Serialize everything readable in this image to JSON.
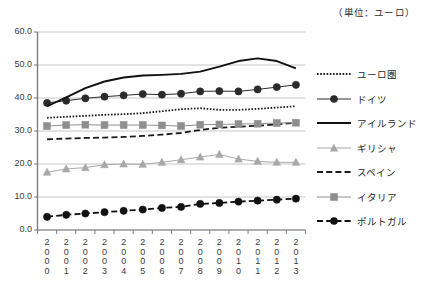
{
  "unit_caption": "（単位：ユーロ）",
  "legend": {
    "position": "right",
    "items": [
      {
        "label": "ユーロ圏",
        "key": "dotted-line-key",
        "color": "#1a1a1a",
        "style": "dotted",
        "marker": "none"
      },
      {
        "label": "ドイツ",
        "key": "line-circle-key",
        "color": "#2b2b2b",
        "style": "solid-thin",
        "marker": "circle"
      },
      {
        "label": "アイルランド",
        "key": "thick-solid-line-key",
        "color": "#111111",
        "style": "solid-thick",
        "marker": "none"
      },
      {
        "label": "ギリシャ",
        "key": "gray-line-triangle-key",
        "color": "#a8a8a8",
        "style": "solid-thin",
        "marker": "triangle"
      },
      {
        "label": "スペイン",
        "key": "dashed-line-key",
        "color": "#1a1a1a",
        "style": "dashed",
        "marker": "none"
      },
      {
        "label": "イタリア",
        "key": "gray-line-square-key",
        "color": "#8f8f8f",
        "style": "solid-thin",
        "marker": "square"
      },
      {
        "label": "ポルトガル",
        "key": "dashed-line-circle-key",
        "color": "#111111",
        "style": "dashed",
        "marker": "circle"
      }
    ]
  },
  "axes": {
    "y_ticks": [
      "0.0",
      "10.0",
      "20.0",
      "30.0",
      "40.0",
      "50.0",
      "60.0"
    ],
    "x_ticks": [
      "2\n0\n0\n0",
      "2\n0\n0\n1",
      "2\n0\n0\n2",
      "2\n0\n0\n3",
      "2\n0\n0\n4",
      "2\n0\n0\n5",
      "2\n0\n0\n6",
      "2\n0\n0\n7",
      "2\n0\n0\n8",
      "2\n0\n0\n9",
      "2\n0\n1\n0",
      "2\n0\n1\n1",
      "2\n0\n1\n2",
      "2\n0\n1\n3"
    ]
  },
  "chart_data": {
    "type": "line",
    "title": "",
    "subtitle": "",
    "xlabel": "",
    "ylabel": "",
    "unit": "ユーロ",
    "ylim": [
      0.0,
      60.0
    ],
    "ytick_step": 10.0,
    "grid": "horizontal",
    "legend_position": "right",
    "categories": [
      2000,
      2001,
      2002,
      2003,
      2004,
      2005,
      2006,
      2007,
      2008,
      2009,
      2010,
      2011,
      2012,
      2013
    ],
    "series": [
      {
        "name": "ユーロ圏",
        "color": "#1a1a1a",
        "line_style": "dotted",
        "marker": "none",
        "values": [
          34.0,
          34.3,
          34.6,
          34.9,
          35.1,
          35.4,
          36.0,
          36.6,
          36.9,
          36.4,
          36.4,
          36.7,
          37.1,
          37.5
        ]
      },
      {
        "name": "ドイツ",
        "color": "#2b2b2b",
        "line_style": "solid-thin",
        "marker": "circle",
        "values": [
          38.5,
          39.2,
          39.9,
          40.4,
          40.8,
          41.2,
          41.0,
          41.3,
          42.0,
          42.1,
          42.0,
          42.6,
          43.3,
          44.0
        ]
      },
      {
        "name": "アイルランド",
        "color": "#111111",
        "line_style": "solid-thick",
        "marker": "none",
        "values": [
          37.5,
          40.2,
          43.0,
          45.0,
          46.2,
          46.8,
          47.0,
          47.3,
          48.0,
          49.5,
          51.2,
          52.0,
          51.2,
          49.0
        ]
      },
      {
        "name": "ギリシャ",
        "color": "#a8a8a8",
        "line_style": "solid-thin",
        "marker": "triangle",
        "values": [
          17.5,
          18.5,
          18.9,
          19.8,
          20.0,
          19.9,
          20.5,
          21.3,
          22.1,
          22.9,
          21.5,
          20.8,
          20.5,
          20.5
        ]
      },
      {
        "name": "スペイン",
        "color": "#1a1a1a",
        "line_style": "dashed",
        "marker": "none",
        "values": [
          27.5,
          27.7,
          27.9,
          28.0,
          28.2,
          28.5,
          28.9,
          29.4,
          30.3,
          31.0,
          31.3,
          31.6,
          32.0,
          32.5
        ]
      },
      {
        "name": "イタリア",
        "color": "#8f8f8f",
        "line_style": "solid-thin",
        "marker": "square",
        "values": [
          31.5,
          31.8,
          31.9,
          31.8,
          31.8,
          31.8,
          31.7,
          31.5,
          31.9,
          32.0,
          32.1,
          32.2,
          32.4,
          32.5
        ]
      },
      {
        "name": "ポルトガル",
        "color": "#111111",
        "line_style": "dashed",
        "marker": "circle",
        "values": [
          4.0,
          4.6,
          5.0,
          5.4,
          5.8,
          6.2,
          6.7,
          7.0,
          7.9,
          8.2,
          8.6,
          8.9,
          9.2,
          9.5
        ]
      }
    ]
  }
}
